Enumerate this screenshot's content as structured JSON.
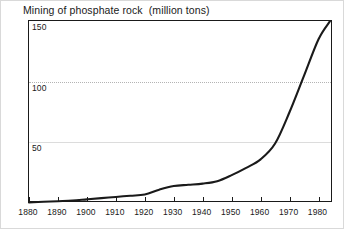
{
  "chart_data": {
    "type": "line",
    "title": "Mining of phosphate rock  (million tons)",
    "xlabel": "",
    "ylabel": "",
    "unit": "million tons",
    "xlim": [
      1880,
      1985
    ],
    "ylim": [
      0,
      150
    ],
    "grid": true,
    "legend": "none",
    "y_ticks": [
      {
        "value": 150,
        "label": "150",
        "style": "frame"
      },
      {
        "value": 100,
        "label": "100",
        "style": "dotted"
      },
      {
        "value": 50,
        "label": "50",
        "style": "solid"
      }
    ],
    "x_ticks": [
      {
        "value": 1880,
        "label": "1880"
      },
      {
        "value": 1890,
        "label": "1890"
      },
      {
        "value": 1900,
        "label": "1900"
      },
      {
        "value": 1910,
        "label": "1910"
      },
      {
        "value": 1920,
        "label": "1920"
      },
      {
        "value": 1930,
        "label": "1930"
      },
      {
        "value": 1940,
        "label": "1940"
      },
      {
        "value": 1950,
        "label": "1950"
      },
      {
        "value": 1960,
        "label": "1960"
      },
      {
        "value": 1970,
        "label": "1970"
      },
      {
        "value": 1980,
        "label": "1980"
      }
    ],
    "series": [
      {
        "name": "Mining of phosphate rock",
        "color": "#1a1a1a",
        "x": [
          1880,
          1885,
          1890,
          1895,
          1900,
          1905,
          1910,
          1915,
          1920,
          1925,
          1930,
          1935,
          1940,
          1945,
          1950,
          1955,
          1960,
          1965,
          1970,
          1975,
          1980,
          1984
        ],
        "values": [
          0.5,
          1,
          1.5,
          2,
          3,
          4,
          5,
          6,
          7,
          11,
          14,
          15,
          16,
          18,
          23,
          29,
          36,
          49,
          75,
          105,
          135,
          150
        ]
      }
    ]
  },
  "colors": {
    "line": "#1a1a1a",
    "axis": "#1a1a1a",
    "grid_solid": "#dcdcdc",
    "grid_dotted": "#b4b4b4",
    "background": "#ffffff",
    "outer_border": "#d9d9d9"
  }
}
